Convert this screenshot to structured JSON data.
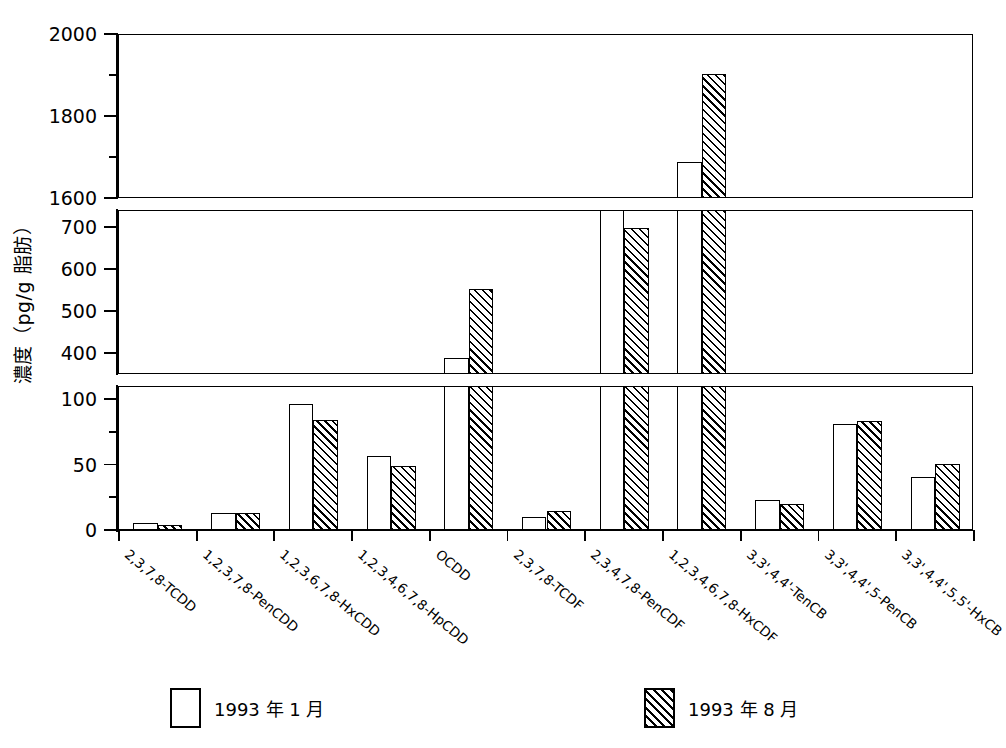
{
  "chart_data": {
    "type": "bar",
    "title": "",
    "xlabel": "",
    "ylabel": "濃度（pg/g 脂肪）",
    "grid": false,
    "legend_position": "bottom",
    "broken_axis": true,
    "axis_segments": [
      {
        "name": "top",
        "range": [
          1600,
          2000
        ],
        "ticks_major": [
          1600,
          1800,
          2000
        ],
        "ticks_minor": [
          1700,
          1900
        ]
      },
      {
        "name": "middle",
        "range": [
          350,
          740
        ],
        "ticks_major": [
          400,
          500,
          600,
          700
        ],
        "ticks_minor": []
      },
      {
        "name": "bottom",
        "range": [
          0,
          110
        ],
        "ticks_major": [
          0,
          50,
          100
        ],
        "ticks_minor": [
          25,
          75
        ]
      }
    ],
    "categories": [
      "2,3,7,8-TCDD",
      "1,2,3,7,8-PenCDD",
      "1,2,3,6,7,8-HxCDD",
      "1,2,3,4,6,7,8-HpCDD",
      "OCDD",
      "2,3,7,8-TCDF",
      "2,3,4,7,8-PenCDF",
      "1,2,3,4,6,7,8-HxCDF",
      "3,3',4,4'-TenCB",
      "3,3',4,4',5-PenCB",
      "3,3',4,4',5,5'-HxCB"
    ],
    "series": [
      {
        "name": "1993 年 1 月",
        "style": "open",
        "values": [
          6,
          14,
          97,
          57,
          390,
          11,
          745,
          1690,
          24,
          82,
          41
        ]
      },
      {
        "name": "1993 年 8 月",
        "style": "hatched",
        "values": [
          4.5,
          13.5,
          85,
          50,
          555,
          15,
          700,
          1905,
          21,
          84,
          51
        ]
      }
    ]
  },
  "legend": {
    "items": [
      {
        "label": "1993 年 1 月",
        "style": "open"
      },
      {
        "label": "1993 年 8 月",
        "style": "hatched"
      }
    ]
  },
  "axis": {
    "y_tick_labels_top": [
      "2000",
      "1800",
      "1600"
    ],
    "y_tick_labels_middle": [
      "700",
      "600",
      "500",
      "400"
    ],
    "y_tick_labels_bottom": [
      "100",
      "50",
      "0"
    ]
  }
}
